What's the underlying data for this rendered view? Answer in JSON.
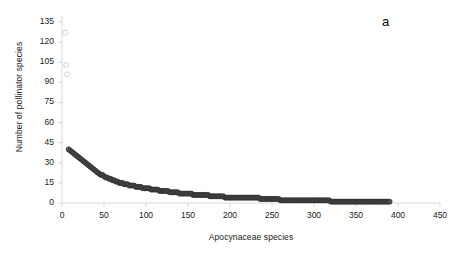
{
  "panel": {
    "label": "a"
  },
  "axes": {
    "x": {
      "title": "Apocynaceae species",
      "ticks": [
        0,
        50,
        100,
        150,
        200,
        250,
        300,
        350,
        400,
        450
      ],
      "min": 0,
      "max": 450
    },
    "y": {
      "title": "Number of pollinator species",
      "ticks": [
        0,
        15,
        30,
        45,
        60,
        75,
        90,
        105,
        120,
        135
      ],
      "min": 0,
      "max": 135
    }
  },
  "style": {
    "axis_color": "#d9d9d9",
    "tick_color": "#d9d9d9",
    "text_color": "#1a1a1a",
    "marker_dark_fill": "#4a4a4a",
    "marker_dark_edge": "#2b2b2b",
    "marker_light_fill": "#ffffff",
    "marker_light_edge": "#c8c8c8",
    "background": "#ffffff"
  },
  "chart_data": {
    "type": "scatter",
    "title": "",
    "xlabel": "Apocynaceae species",
    "ylabel": "Number of pollinator species",
    "xlim": [
      0,
      450
    ],
    "ylim": [
      0,
      135
    ],
    "grid": false,
    "legend": null,
    "annotations": [
      {
        "text": "a",
        "x_px": 388,
        "y_px": 22
      }
    ],
    "series": [
      {
        "name": "outliers",
        "marker": "open-circle-light",
        "points": [
          [
            4,
            127
          ],
          [
            5,
            103
          ],
          [
            6,
            96
          ]
        ]
      },
      {
        "name": "rank-abundance",
        "marker": "filled-circle-dark",
        "comment": "Rank-ordered number of pollinator species per Apocynaceae species; steep decline then long tail to ~1.",
        "points": [
          [
            8,
            40
          ],
          [
            10,
            39
          ],
          [
            12,
            38
          ],
          [
            14,
            37
          ],
          [
            16,
            36
          ],
          [
            18,
            35
          ],
          [
            20,
            34
          ],
          [
            22,
            33
          ],
          [
            24,
            32
          ],
          [
            26,
            31
          ],
          [
            28,
            30
          ],
          [
            30,
            29
          ],
          [
            32,
            28
          ],
          [
            34,
            27
          ],
          [
            36,
            26
          ],
          [
            38,
            25
          ],
          [
            40,
            24
          ],
          [
            42,
            23
          ],
          [
            44,
            22
          ],
          [
            46,
            21
          ],
          [
            48,
            21
          ],
          [
            50,
            20
          ],
          [
            52,
            19
          ],
          [
            54,
            19
          ],
          [
            56,
            18
          ],
          [
            58,
            18
          ],
          [
            60,
            17
          ],
          [
            62,
            17
          ],
          [
            64,
            16
          ],
          [
            66,
            16
          ],
          [
            68,
            15
          ],
          [
            70,
            15
          ],
          [
            72,
            15
          ],
          [
            74,
            14
          ],
          [
            76,
            14
          ],
          [
            78,
            14
          ],
          [
            80,
            13
          ],
          [
            82,
            13
          ],
          [
            84,
            13
          ],
          [
            86,
            13
          ],
          [
            88,
            12
          ],
          [
            90,
            12
          ],
          [
            92,
            12
          ],
          [
            94,
            12
          ],
          [
            96,
            11
          ],
          [
            98,
            11
          ],
          [
            100,
            11
          ],
          [
            102,
            11
          ],
          [
            104,
            11
          ],
          [
            106,
            10
          ],
          [
            108,
            10
          ],
          [
            110,
            10
          ],
          [
            112,
            10
          ],
          [
            114,
            10
          ],
          [
            116,
            9
          ],
          [
            118,
            9
          ],
          [
            120,
            9
          ],
          [
            122,
            9
          ],
          [
            124,
            9
          ],
          [
            126,
            9
          ],
          [
            128,
            8
          ],
          [
            130,
            8
          ],
          [
            132,
            8
          ],
          [
            134,
            8
          ],
          [
            136,
            8
          ],
          [
            138,
            8
          ],
          [
            140,
            7
          ],
          [
            142,
            7
          ],
          [
            144,
            7
          ],
          [
            146,
            7
          ],
          [
            148,
            7
          ],
          [
            150,
            7
          ],
          [
            152,
            7
          ],
          [
            154,
            7
          ],
          [
            156,
            6
          ],
          [
            158,
            6
          ],
          [
            160,
            6
          ],
          [
            162,
            6
          ],
          [
            164,
            6
          ],
          [
            166,
            6
          ],
          [
            168,
            6
          ],
          [
            170,
            6
          ],
          [
            172,
            6
          ],
          [
            174,
            6
          ],
          [
            176,
            5
          ],
          [
            178,
            5
          ],
          [
            180,
            5
          ],
          [
            182,
            5
          ],
          [
            184,
            5
          ],
          [
            186,
            5
          ],
          [
            188,
            5
          ],
          [
            190,
            5
          ],
          [
            192,
            5
          ],
          [
            194,
            4
          ],
          [
            196,
            4
          ],
          [
            198,
            4
          ],
          [
            200,
            4
          ],
          [
            202,
            4
          ],
          [
            204,
            4
          ],
          [
            206,
            4
          ],
          [
            208,
            4
          ],
          [
            210,
            4
          ],
          [
            212,
            4
          ],
          [
            214,
            4
          ],
          [
            216,
            4
          ],
          [
            218,
            4
          ],
          [
            220,
            4
          ],
          [
            222,
            4
          ],
          [
            224,
            4
          ],
          [
            226,
            4
          ],
          [
            228,
            4
          ],
          [
            230,
            4
          ],
          [
            232,
            4
          ],
          [
            234,
            4
          ],
          [
            236,
            3
          ],
          [
            238,
            3
          ],
          [
            240,
            3
          ],
          [
            242,
            3
          ],
          [
            244,
            3
          ],
          [
            246,
            3
          ],
          [
            248,
            3
          ],
          [
            250,
            3
          ],
          [
            252,
            3
          ],
          [
            254,
            3
          ],
          [
            256,
            3
          ],
          [
            258,
            3
          ],
          [
            260,
            2
          ],
          [
            262,
            2
          ],
          [
            264,
            2
          ],
          [
            266,
            2
          ],
          [
            268,
            2
          ],
          [
            270,
            2
          ],
          [
            272,
            2
          ],
          [
            274,
            2
          ],
          [
            276,
            2
          ],
          [
            278,
            2
          ],
          [
            280,
            2
          ],
          [
            282,
            2
          ],
          [
            284,
            2
          ],
          [
            286,
            2
          ],
          [
            288,
            2
          ],
          [
            290,
            2
          ],
          [
            292,
            2
          ],
          [
            294,
            2
          ],
          [
            296,
            2
          ],
          [
            298,
            2
          ],
          [
            300,
            2
          ],
          [
            302,
            2
          ],
          [
            304,
            2
          ],
          [
            306,
            2
          ],
          [
            308,
            2
          ],
          [
            310,
            2
          ],
          [
            312,
            2
          ],
          [
            314,
            2
          ],
          [
            316,
            2
          ],
          [
            318,
            2
          ],
          [
            320,
            1
          ],
          [
            322,
            1
          ],
          [
            324,
            1
          ],
          [
            326,
            1
          ],
          [
            328,
            1
          ],
          [
            330,
            1
          ],
          [
            332,
            1
          ],
          [
            334,
            1
          ],
          [
            336,
            1
          ],
          [
            338,
            1
          ],
          [
            340,
            1
          ],
          [
            342,
            1
          ],
          [
            344,
            1
          ],
          [
            346,
            1
          ],
          [
            348,
            1
          ],
          [
            350,
            1
          ],
          [
            352,
            1
          ],
          [
            354,
            1
          ],
          [
            356,
            1
          ],
          [
            358,
            1
          ],
          [
            360,
            1
          ],
          [
            362,
            1
          ],
          [
            364,
            1
          ],
          [
            366,
            1
          ],
          [
            368,
            1
          ],
          [
            370,
            1
          ],
          [
            372,
            1
          ],
          [
            374,
            1
          ],
          [
            376,
            1
          ],
          [
            378,
            1
          ],
          [
            380,
            1
          ],
          [
            382,
            1
          ],
          [
            384,
            1
          ],
          [
            386,
            1
          ],
          [
            388,
            1
          ],
          [
            390,
            1
          ]
        ]
      }
    ]
  }
}
